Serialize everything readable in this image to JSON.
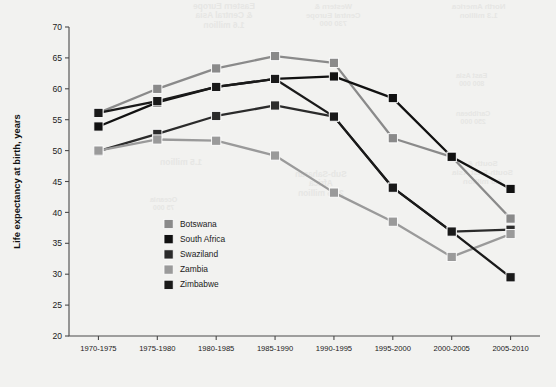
{
  "chart_data": {
    "type": "line",
    "title": "",
    "subtitle": "",
    "xlabel": "",
    "ylabel": "Life expectancy at birth, years",
    "categories": [
      "1970-1975",
      "1975-1980",
      "1980-1985",
      "1985-1990",
      "1990-1995",
      "1995-2000",
      "2000-2005",
      "2005-2010"
    ],
    "ylim": [
      20,
      70
    ],
    "yticks": [
      20,
      25,
      30,
      35,
      40,
      45,
      50,
      55,
      60,
      65,
      70
    ],
    "grid": false,
    "legend_position": "inside-lower-left",
    "series": [
      {
        "name": "Botswana",
        "color": "#8a8a8a",
        "values": [
          56.1,
          60.0,
          63.3,
          65.3,
          64.2,
          52.0,
          49.0,
          39.0
        ]
      },
      {
        "name": "South Africa",
        "color": "#111111",
        "values": [
          53.9,
          57.8,
          60.3,
          61.6,
          62.0,
          58.5,
          49.0,
          43.8
        ]
      },
      {
        "name": "Swaziland",
        "color": "#2b2b2b",
        "values": [
          49.9,
          52.7,
          55.6,
          57.3,
          55.5,
          44.0,
          36.9,
          37.2
        ]
      },
      {
        "name": "Zambia",
        "color": "#9a9a9a",
        "values": [
          50.0,
          51.8,
          51.6,
          49.2,
          43.2,
          38.5,
          32.8,
          36.5
        ]
      },
      {
        "name": "Zimbabwe",
        "color": "#1a1a1a",
        "values": [
          56.1,
          58.0,
          60.3,
          61.6,
          55.5,
          44.0,
          36.9,
          29.5
        ]
      }
    ]
  },
  "watermarks": [
    {
      "text": "Eastern Europe\n& Central Asia\n1.6 million",
      "x": 193,
      "y": 2,
      "size": 8.4
    },
    {
      "text": "Western &\nCentral Europe\n730 000",
      "x": 306,
      "y": 3,
      "size": 7.6
    },
    {
      "text": "North America\n1.3 million",
      "x": 452,
      "y": 3,
      "size": 7.8
    },
    {
      "text": "East Asia\n800 000",
      "x": 456,
      "y": 72,
      "size": 7.0
    },
    {
      "text": "Caribbean\n250 000",
      "x": 456,
      "y": 110,
      "size": 7.0
    },
    {
      "text": "1.5 million",
      "x": 160,
      "y": 158,
      "size": 8.6
    },
    {
      "text": "Oceania\n75 000",
      "x": 150,
      "y": 196,
      "size": 7.0
    },
    {
      "text": "Sub-Saharan\nAfrica\n22.5 million",
      "x": 295,
      "y": 170,
      "size": 8.4
    },
    {
      "text": "South &\nSouth-East Asia\n4.0 million",
      "x": 452,
      "y": 160,
      "size": 8.0
    }
  ]
}
